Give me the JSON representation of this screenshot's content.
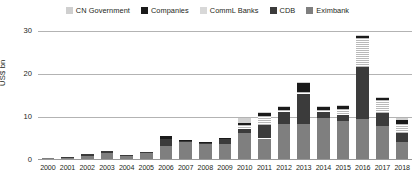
{
  "chart_data": {
    "type": "bar",
    "stacked": true,
    "title": "",
    "subtitle": "",
    "xlabel": "",
    "ylabel": "US$ bn",
    "ylim": [
      0,
      30
    ],
    "yticks": [
      0,
      10,
      20,
      30
    ],
    "ytick_labels": [
      "0",
      "10",
      "20",
      "30"
    ],
    "grid": true,
    "legend_position": "top-center",
    "categories": [
      "2000",
      "2001",
      "2002",
      "2003",
      "2004",
      "2005",
      "2006",
      "2007",
      "2008",
      "2009",
      "2010",
      "2011",
      "2012",
      "2013",
      "2014",
      "2015",
      "2016",
      "2017",
      "2018"
    ],
    "series": [
      {
        "name": "Eximbank",
        "color": "#7f7f7f",
        "values": [
          0.2,
          0.3,
          0.8,
          1.4,
          0.7,
          1.3,
          3.1,
          3.9,
          3.4,
          3.5,
          6.0,
          4.8,
          8.3,
          8.2,
          9.5,
          9.0,
          9.3,
          7.8,
          4.1
        ]
      },
      {
        "name": "CDB",
        "color": "#3b3b3b",
        "values": [
          0.0,
          0.2,
          0.3,
          0.4,
          0.2,
          0.3,
          1.5,
          0.3,
          0.5,
          1.2,
          1.0,
          3.1,
          2.7,
          7.0,
          1.4,
          1.3,
          12.2,
          3.0,
          1.9
        ]
      },
      {
        "name": "CommL Banks",
        "color": "#d8d8d8",
        "hatched": true,
        "values": [
          0.0,
          0.0,
          0.0,
          0.0,
          0.0,
          0.0,
          0.0,
          0.0,
          0.0,
          0.0,
          1.0,
          2.2,
          0.5,
          0.4,
          0.6,
          1.4,
          6.8,
          3.0,
          2.1
        ]
      },
      {
        "name": "Companies",
        "color": "#1a1a1a",
        "values": [
          0.0,
          0.0,
          0.0,
          0.0,
          0.0,
          0.0,
          0.8,
          0.3,
          0.2,
          0.3,
          0.5,
          0.7,
          0.6,
          2.2,
          0.7,
          0.7,
          0.5,
          0.4,
          1.0
        ]
      },
      {
        "name": "CN Government",
        "color": "#cfcfcf",
        "values": [
          0.0,
          0.0,
          0.0,
          0.0,
          0.0,
          0.0,
          0.0,
          0.0,
          0.0,
          0.0,
          1.1,
          0.3,
          0.3,
          0.3,
          0.3,
          0.3,
          0.3,
          0.3,
          0.5
        ]
      }
    ],
    "totals": [
      0.2,
      0.5,
      1.1,
      1.8,
      0.9,
      1.6,
      5.4,
      4.5,
      4.1,
      5.0,
      9.6,
      11.1,
      12.4,
      18.1,
      12.5,
      12.7,
      29.1,
      14.5,
      9.6
    ]
  },
  "legend": {
    "items": [
      {
        "label": "CN Government",
        "color": "#cfcfcf"
      },
      {
        "label": "Companies",
        "color": "#1a1a1a"
      },
      {
        "label": "CommL Banks",
        "color": "#d8d8d8"
      },
      {
        "label": "CDB",
        "color": "#3b3b3b"
      },
      {
        "label": "Eximbank",
        "color": "#7f7f7f"
      }
    ]
  },
  "axes": {
    "y_title": "US$ bn",
    "y_tick_labels": [
      "30",
      "20",
      "10",
      "0"
    ],
    "x_tick_labels": [
      "2000",
      "2001",
      "2002",
      "2003",
      "2004",
      "2005",
      "2006",
      "2007",
      "2008",
      "2009",
      "2010",
      "2011",
      "2012",
      "2013",
      "2014",
      "2015",
      "2016",
      "2017",
      "2018"
    ]
  },
  "colors": {
    "gridline": "#b3b3b3",
    "text": "#231f20",
    "background": "#ffffff"
  }
}
